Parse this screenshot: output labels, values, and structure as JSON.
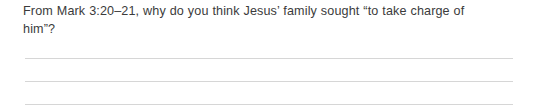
{
  "page": {
    "background_color": "#ffffff",
    "width": 537,
    "height": 109
  },
  "question": {
    "prompt_text": "From Mark 3:20–21, why do you think Jesus’ family sought “to take charge of him”?",
    "prompt_line_1": "From Mark 3:20–21, why do you think Jesus’ family sought “to take charge",
    "prompt_line_2": "of him”?",
    "scripture_reference": "Mark 3:20–21",
    "text_color": "#3b3b3b"
  },
  "answer_area": {
    "line_color": "#d6d6d6",
    "line_count": 3,
    "lines": [
      {
        "index": 1,
        "value": ""
      },
      {
        "index": 2,
        "value": ""
      },
      {
        "index": 3,
        "value": ""
      }
    ]
  }
}
